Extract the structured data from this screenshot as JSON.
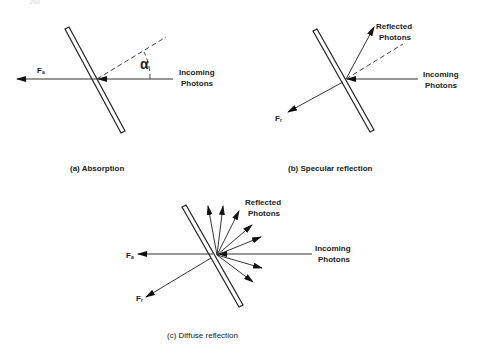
{
  "figure": {
    "page_number_faint": "290",
    "panels": [
      {
        "id": "a",
        "caption": "(a) Absorption",
        "labels": {
          "force": "F",
          "force_sub": "a",
          "angle": "α",
          "incoming_line1": "Incoming",
          "incoming_line2": "Photons"
        }
      },
      {
        "id": "b",
        "caption": "(b) Specular reflection",
        "labels": {
          "force": "F",
          "force_sub": "r",
          "reflected_line1": "Reflected",
          "reflected_line2": "Photons",
          "incoming_line1": "Incoming",
          "incoming_line2": "Photons"
        }
      },
      {
        "id": "c",
        "caption": "(c) Diffuse reflection",
        "labels": {
          "force_a": "F",
          "force_a_sub": "a",
          "force_r": "F",
          "force_r_sub": "r",
          "reflected_line1": "Reflected",
          "reflected_line2": "Photons",
          "incoming_line1": "Incoming",
          "incoming_line2": "Photons"
        }
      }
    ],
    "colors": {
      "ink": "#222222",
      "background": "#ffffff"
    }
  }
}
